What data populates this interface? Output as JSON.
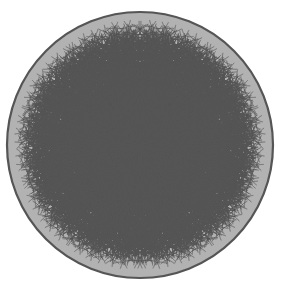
{
  "figure": {
    "type": "diagram",
    "background_color": "#ffffff"
  },
  "disk": {
    "center_x": 140,
    "center_y": 145,
    "radius": 133,
    "boundary_color": "#555555",
    "boundary_width": 2.2,
    "fill_color": "#b2b2b2"
  },
  "palette": {
    "light_tile": "#b4b4b4",
    "dark_tile": "#949494",
    "edge_color": "#555555",
    "edge_width": 3.2,
    "outer_haze": "#8e8e8e"
  },
  "tiling": {
    "schlafli": "(3,5,3,5)",
    "description": "order-5 quasiregular tiling of triangles and pentagons",
    "central_vertex": {
      "x": 140,
      "y": 145
    },
    "valence": 5,
    "recursion_depth": 6
  },
  "chart_data": {
    "type": "diagram",
    "xlabel": "",
    "ylabel": "",
    "legend": [],
    "annotations": [],
    "tile_shades": [
      "#b4b4b4",
      "#949494"
    ],
    "tile_counts": {
      "visible_light": 34,
      "visible_dark": 26
    }
  }
}
